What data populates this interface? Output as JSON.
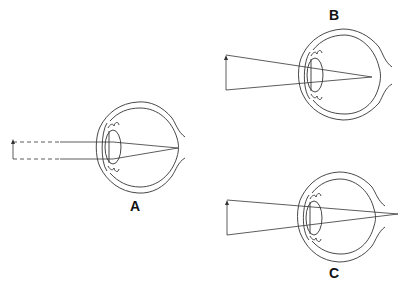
{
  "diagram": {
    "title": "",
    "panels": [
      {
        "id": "A",
        "label": "A",
        "description": "Emmetropic eye: parallel rays (dashed, from distant object) focus on retina"
      },
      {
        "id": "B",
        "label": "B",
        "description": "Eye with rays from near object converging on retina"
      },
      {
        "id": "C",
        "label": "C",
        "description": "Eye with rays focusing behind the retina"
      }
    ]
  },
  "colors": {
    "line": "#333333",
    "background": "#ffffff",
    "label": "#111111"
  }
}
